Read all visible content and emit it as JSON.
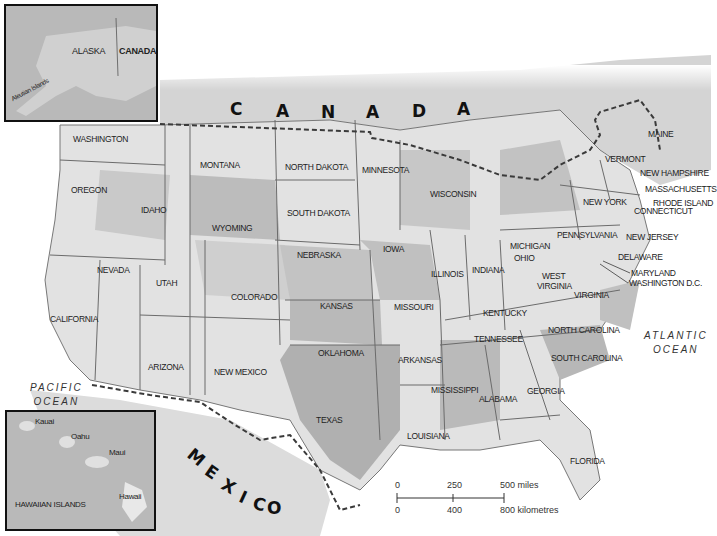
{
  "map": {
    "title": "United States physical-political map",
    "countries": [
      "CANADA",
      "MEXICO"
    ],
    "canada_letters": [
      "C",
      "A",
      "N",
      "A",
      "D",
      "A"
    ],
    "mexico_letters": [
      "M",
      "E",
      "X",
      "I",
      "C",
      "O"
    ],
    "oceans": {
      "pacific": [
        "PACIFIC",
        "OCEAN"
      ],
      "atlantic": [
        "ATLANTIC",
        "OCEAN"
      ]
    },
    "states": {
      "washington": "WASHINGTON",
      "oregon": "OREGON",
      "idaho": "IDAHO",
      "montana": "MONTANA",
      "wyoming": "WYOMING",
      "nevada": "NEVADA",
      "utah": "UTAH",
      "colorado": "COLORADO",
      "california": "CALIFORNIA",
      "arizona": "ARIZONA",
      "new_mexico": "NEW MEXICO",
      "north_dakota": "NORTH DAKOTA",
      "south_dakota": "SOUTH DAKOTA",
      "nebraska": "NEBRASKA",
      "kansas": "KANSAS",
      "oklahoma": "OKLAHOMA",
      "texas": "TEXAS",
      "minnesota": "MINNESOTA",
      "iowa": "IOWA",
      "missouri": "MISSOURI",
      "arkansas": "ARKANSAS",
      "louisiana": "LOUISIANA",
      "wisconsin": "WISCONSIN",
      "illinois": "ILLINOIS",
      "michigan": "MICHIGAN",
      "indiana": "INDIANA",
      "ohio": "OHIO",
      "kentucky": "KENTUCKY",
      "tennessee": "TENNESSEE",
      "mississippi": "MISSISSIPPI",
      "alabama": "ALABAMA",
      "georgia": "GEORGIA",
      "florida": "FLORIDA",
      "south_carolina": "SOUTH CAROLINA",
      "north_carolina": "NORTH CAROLINA",
      "virginia": "VIRGINIA",
      "west_virginia_1": "WEST",
      "west_virginia_2": "VIRGINIA",
      "pennsylvania": "PENNSYLVANIA",
      "new_york": "NEW YORK",
      "vermont": "VERMONT",
      "maine": "MAINE",
      "new_hampshire": "NEW HAMPSHIRE",
      "massachusetts": "MASSACHUSETTS",
      "rhode_island": "RHODE ISLAND",
      "connecticut": "CONNECTICUT",
      "new_jersey": "NEW JERSEY",
      "delaware": "DELAWARE",
      "maryland": "MARYLAND",
      "washington_dc": "WASHINGTON D.C."
    },
    "insets": {
      "alaska": {
        "alaska_label": "ALASKA",
        "canada_label": "CANADA",
        "islands_label": "Aleutian Islands"
      },
      "hawaii": {
        "title": "HAWAIIAN ISLANDS",
        "islands": [
          "Kauai",
          "Oahu",
          "Maui",
          "Hawaii"
        ]
      }
    },
    "scale_bar": {
      "miles": [
        "0",
        "250",
        "500 miles"
      ],
      "kilometres": [
        "0",
        "400",
        "800 kilometres"
      ]
    },
    "colors": {
      "land_light": "#e6e6e6",
      "land_mid": "#c8c8c8",
      "land_dark": "#a8a8a8",
      "border": "#6b6b6b",
      "intl_border": "#3a3a3a",
      "inset_bg": "#b9b9b9"
    }
  }
}
